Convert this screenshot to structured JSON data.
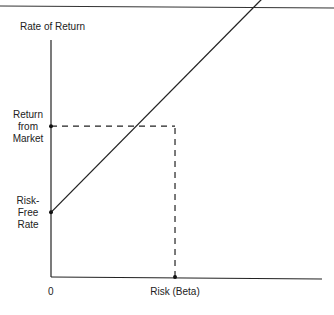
{
  "chart_data": {
    "type": "line",
    "title": "",
    "xlabel": "Risk (Beta)",
    "ylabel": "Rate of Return",
    "x_tick_labels": [
      "0"
    ],
    "y_annotations": [
      {
        "lines": [
          "Return",
          "from",
          "Market"
        ],
        "y": 0.7
      },
      {
        "lines": [
          "Risk-",
          "Free",
          "Rate"
        ],
        "y": 0.3
      }
    ],
    "xlim": [
      0,
      1.7
    ],
    "ylim": [
      0,
      1.1
    ],
    "series": [
      {
        "name": "Security Market Line",
        "x": [
          0,
          1.7
        ],
        "y": [
          0.3,
          1.29
        ]
      }
    ],
    "reference_lines": [
      {
        "type": "horizontal",
        "y": 0.7,
        "x_from": 0,
        "x_to": 1.0,
        "style": "dashed"
      },
      {
        "type": "vertical",
        "x": 1.0,
        "y_from": 0,
        "y_to": 0.7,
        "style": "dashed"
      }
    ],
    "points": [
      {
        "x": 0,
        "y": 0.3
      },
      {
        "x": 0,
        "y": 0.7
      },
      {
        "x": 1.0,
        "y": 0
      }
    ],
    "grid": false,
    "legend": "none"
  }
}
